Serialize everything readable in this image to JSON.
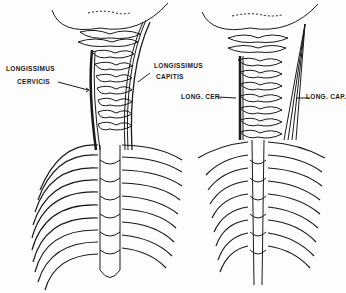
{
  "figure": {
    "panels": [
      {
        "id": "left",
        "labels": {
          "longissimus_cervicis_line1": "LONGISSIMUS",
          "longissimus_cervicis_line2": "CERVICIS",
          "longissimus_capitis_line1": "LONGISSIMUS",
          "longissimus_capitis_line2": "CAPITIS"
        }
      },
      {
        "id": "right",
        "labels": {
          "long_cer": "LONG. CER.",
          "long_cap": "LONG. CAP."
        }
      }
    ],
    "colors": {
      "ink": "#1a1a1a",
      "paper": "#fdfdfd"
    }
  }
}
